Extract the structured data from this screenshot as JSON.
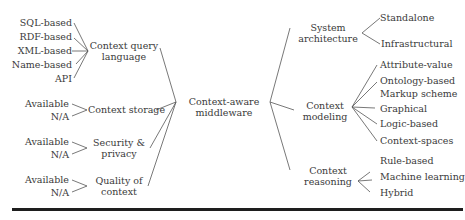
{
  "diagram": {
    "root": "Context-aware middleware",
    "left_branches": [
      {
        "label": "Context query language",
        "children": [
          "SQL-based",
          "RDF-based",
          "XML-based",
          "Name-based",
          "API"
        ]
      },
      {
        "label": "Context storage",
        "children": [
          "Available",
          "N/A"
        ]
      },
      {
        "label": "Security & privacy",
        "children": [
          "Available",
          "N/A"
        ]
      },
      {
        "label": "Quality of context",
        "children": [
          "Available",
          "N/A"
        ]
      }
    ],
    "right_branches": [
      {
        "label": "System architecture",
        "children": [
          "Standalone",
          "Infrastructural"
        ]
      },
      {
        "label": "Context modeling",
        "children": [
          "Attribute-value",
          "Ontology-based",
          "Markup scheme",
          "Graphical",
          "Logic-based",
          "Context-spaces"
        ]
      },
      {
        "label": "Context reasoning",
        "children": [
          "Rule-based",
          "Machine learning",
          "Hybrid"
        ]
      }
    ]
  },
  "labels": {
    "root_line1": "Context-aware",
    "root_line2": "middleware",
    "cql_line1": "Context query",
    "cql_line2": "language",
    "storage": "Context storage",
    "security_line1": "Security &",
    "security_line2": "privacy",
    "quality_line1": "Quality of",
    "quality_line2": "context",
    "sysarch_line1": "System",
    "sysarch_line2": "architecture",
    "modeling_line1": "Context",
    "modeling_line2": "modeling",
    "reasoning_line1": "Context",
    "reasoning_line2": "reasoning"
  }
}
